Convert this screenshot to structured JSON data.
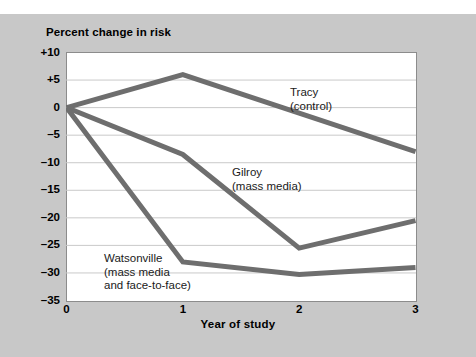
{
  "figure": {
    "title": "Percent change in risk",
    "background_color": "#c8c8c8",
    "plot_background_color": "#ffffff",
    "line_color": "#6e6e6e",
    "grid_color": "#c9c9c9",
    "axis_color": "#8c8c8c"
  },
  "chart_data": {
    "type": "line",
    "title": "Percent change in risk",
    "xlabel": "Year of study",
    "ylabel": "Percent change in risk",
    "x": [
      0,
      1,
      2,
      3
    ],
    "xtick_labels": [
      "0",
      "1",
      "2",
      "3"
    ],
    "ytick_labels": [
      "+10",
      "+5",
      "0",
      "–5",
      "–10",
      "–15",
      "–20",
      "–25",
      "–30",
      "–35"
    ],
    "ytick_values": [
      10,
      5,
      0,
      -5,
      -10,
      -15,
      -20,
      -25,
      -30,
      -35
    ],
    "xlim": [
      0,
      3
    ],
    "ylim": [
      -35,
      10
    ],
    "grid": true,
    "legend": "inline-annotations",
    "series": [
      {
        "name": "Tracy (control)",
        "label_line1": "Tracy",
        "label_line2": "(control)",
        "values": [
          0,
          6,
          -1,
          -8
        ],
        "color": "#6e6e6e"
      },
      {
        "name": "Gilroy (mass media)",
        "label_line1": "Gilroy",
        "label_line2": "(mass media)",
        "values": [
          0,
          -8.5,
          -25.5,
          -20.5
        ],
        "color": "#6e6e6e"
      },
      {
        "name": "Watsonville (mass media and face-to-face)",
        "label_line1": "Watsonville",
        "label_line2": "(mass media",
        "label_line3": "and face-to-face)",
        "values": [
          0,
          -28,
          -30.3,
          -29
        ],
        "color": "#6e6e6e"
      }
    ]
  }
}
